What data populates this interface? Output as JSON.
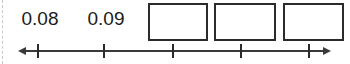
{
  "worksheet": {
    "width": 350,
    "height": 64,
    "background_color": "#ffffff",
    "ink_color": "#2b2b2b",
    "crop_edge": {
      "name": "page-crop-dashed-line",
      "color": "#c9c9c9",
      "x": 2
    }
  },
  "number_line": {
    "axis_y": 51,
    "start_x": 18,
    "end_x": 331,
    "left_arrow": true,
    "right_arrow": true,
    "stroke_color": "#3a3a3a",
    "tick_color": "#2b2b2b",
    "tick_top": 44,
    "tick_bottom": 58,
    "ticks": [
      {
        "name": "tick-1",
        "x": 38,
        "label": "0.08"
      },
      {
        "name": "tick-2",
        "x": 104,
        "label": "0.09"
      },
      {
        "name": "tick-3",
        "x": 173,
        "label": ""
      },
      {
        "name": "tick-4",
        "x": 241,
        "label": ""
      },
      {
        "name": "tick-5",
        "x": 309,
        "label": ""
      }
    ]
  },
  "labels": [
    {
      "name": "label-0-08",
      "text": "0.08",
      "center_x": 40,
      "width": 76
    },
    {
      "name": "label-0-09",
      "text": "0.09",
      "center_x": 106,
      "width": 76
    }
  ],
  "answer_boxes": [
    {
      "name": "answer-box-1",
      "value": "",
      "x": 148,
      "width": 60
    },
    {
      "name": "answer-box-2",
      "value": "",
      "x": 214,
      "width": 62
    },
    {
      "name": "answer-box-3",
      "value": "",
      "x": 283,
      "width": 61
    }
  ]
}
